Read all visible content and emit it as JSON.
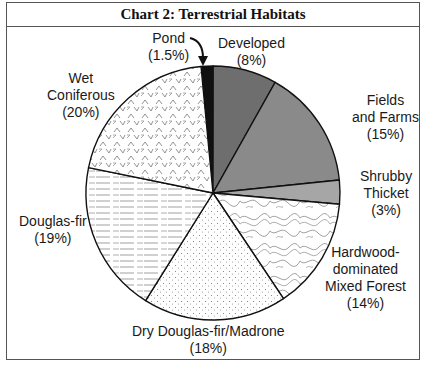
{
  "chart_data": {
    "type": "pie",
    "title": "Chart 2: Terrestrial Habitats",
    "unit": "%",
    "start_angle_deg": -5.4,
    "direction": "clockwise",
    "slices": [
      {
        "label": "Pond",
        "value": 1.5,
        "pct_label": "(1.5%)",
        "fill": "#111111",
        "pattern": "solid"
      },
      {
        "label": "Developed",
        "value": 8,
        "pct_label": "(8%)",
        "fill": "#6e6e6e",
        "pattern": "solid"
      },
      {
        "label": "Fields and Farms",
        "value": 15,
        "pct_label": "(15%)",
        "fill": "#8a8a8a",
        "pattern": "solid"
      },
      {
        "label": "Shrubby Thicket",
        "value": 3,
        "pct_label": "(3%)",
        "fill": "#a6a6a6",
        "pattern": "solid"
      },
      {
        "label": "Hardwood-dominated Mixed Forest",
        "value": 14,
        "pct_label": "(14%)",
        "fill": "#ffffff",
        "pattern": "contour-lines"
      },
      {
        "label": "Dry Douglas-fir/Madrone",
        "value": 18,
        "pct_label": "(18%)",
        "fill": "#ffffff",
        "pattern": "stipple-dots"
      },
      {
        "label": "Douglas-fir",
        "value": 19,
        "pct_label": "(19%)",
        "fill": "#ffffff",
        "pattern": "horizontal-dashes"
      },
      {
        "label": "Wet Coniferous",
        "value": 20,
        "pct_label": "(20%)",
        "fill": "#ffffff",
        "pattern": "chevrons"
      }
    ],
    "legend": "none (direct labels)",
    "annotations": [
      "curved arrow from 'Pond (1.5%)' label to Pond slice"
    ]
  },
  "labels": {
    "pond": {
      "line1": "Pond",
      "line2": "(1.5%)"
    },
    "developed": {
      "line1": "Developed",
      "line2": "(8%)"
    },
    "fields": {
      "line1": "Fields",
      "line2": "and Farms",
      "line3": "(15%)"
    },
    "shrubby": {
      "line1": "Shrubby",
      "line2": "Thicket",
      "line3": "(3%)"
    },
    "hardwood": {
      "line1": "Hardwood-",
      "line2": "dominated",
      "line3": "Mixed Forest",
      "line4": "(14%)"
    },
    "dry": {
      "line1": "Dry Douglas-fir/Madrone",
      "line2": "(18%)"
    },
    "douglas": {
      "line1": "Douglas-fir",
      "line2": "(19%)"
    },
    "wet": {
      "line1": "Wet",
      "line2": "Coniferous",
      "line3": "(20%)"
    }
  }
}
